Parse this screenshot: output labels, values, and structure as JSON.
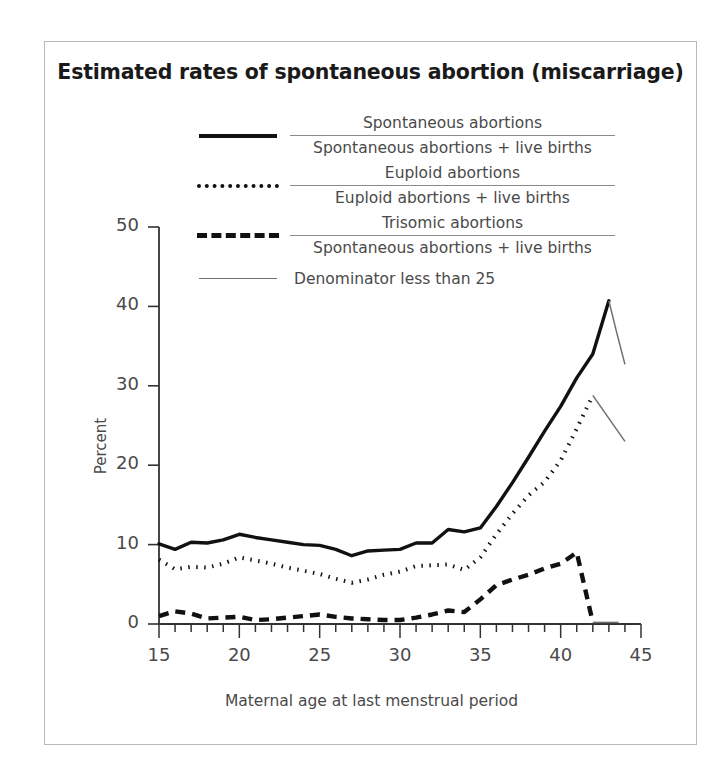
{
  "title": "Estimated rates of spontaneous abortion (miscarriage)",
  "legend": [
    {
      "key": "solid",
      "numerator": "Spontaneous abortions",
      "denominator": "Spontaneous abortions + live births"
    },
    {
      "key": "dotted",
      "numerator": "Euploid abortions",
      "denominator": "Euploid abortions + live births"
    },
    {
      "key": "dashed",
      "numerator": "Trisomic abortions",
      "denominator": "Spontaneous abortions + live births"
    },
    {
      "key": "thin",
      "label": "Denominator less than 25"
    }
  ],
  "chart_data": {
    "type": "line",
    "title": "Estimated rates of spontaneous abortion (miscarriage)",
    "xlabel": "Maternal age at last menstrual period",
    "ylabel": "Percent",
    "xlim": [
      15,
      45
    ],
    "ylim": [
      0,
      50
    ],
    "xticks": [
      15,
      20,
      25,
      30,
      35,
      40,
      45
    ],
    "xtick_minor_step": 1,
    "yticks": [
      0,
      10,
      20,
      30,
      40,
      50
    ],
    "grid": false,
    "legend_position": "upper-center",
    "x": [
      15,
      16,
      17,
      18,
      19,
      20,
      21,
      22,
      23,
      24,
      25,
      26,
      27,
      28,
      29,
      30,
      31,
      32,
      33,
      34,
      35,
      36,
      37,
      38,
      39,
      40,
      41,
      42,
      43,
      44
    ],
    "series": [
      {
        "name": "Spontaneous abortions / Spontaneous abortions + live births",
        "style": "solid",
        "values": [
          10.1,
          9.4,
          10.3,
          10.2,
          10.6,
          11.3,
          10.9,
          10.6,
          10.3,
          10.0,
          9.9,
          9.4,
          8.6,
          9.2,
          9.3,
          9.4,
          10.2,
          10.2,
          11.9,
          11.6,
          12.1,
          14.8,
          17.8,
          21.0,
          24.3,
          27.4,
          31.0,
          34.0,
          40.7,
          null
        ],
        "low_denominator_from": 43,
        "low_denominator_values": [
          40.7,
          36.6,
          32.7
        ],
        "low_denominator_x": [
          43,
          43.5,
          44
        ]
      },
      {
        "name": "Euploid abortions / Euploid abortions + live births",
        "style": "dotted",
        "values": [
          8.1,
          6.9,
          7.2,
          7.1,
          7.6,
          8.4,
          8.0,
          7.6,
          7.1,
          6.7,
          6.3,
          5.7,
          5.2,
          5.6,
          6.2,
          6.6,
          7.3,
          7.4,
          7.5,
          6.8,
          8.4,
          11.3,
          13.9,
          16.2,
          17.9,
          20.6,
          24.6,
          28.8,
          null,
          null
        ],
        "low_denominator_from": 42,
        "low_denominator_values": [
          28.8,
          23.0
        ],
        "low_denominator_x": [
          42,
          44
        ]
      },
      {
        "name": "Trisomic abortions / Spontaneous abortions + live births",
        "style": "dashed",
        "values": [
          1.0,
          1.6,
          1.3,
          0.7,
          0.8,
          0.9,
          0.5,
          0.6,
          0.8,
          1.0,
          1.2,
          0.9,
          0.7,
          0.6,
          0.5,
          0.5,
          0.8,
          1.2,
          1.7,
          1.5,
          3.1,
          4.9,
          5.6,
          6.2,
          7.0,
          7.6,
          9.0,
          0.2,
          null,
          null
        ],
        "low_denominator_from": 42,
        "low_denominator_values": [
          0.2,
          0.2
        ],
        "low_denominator_x": [
          42,
          43.6
        ]
      }
    ]
  }
}
